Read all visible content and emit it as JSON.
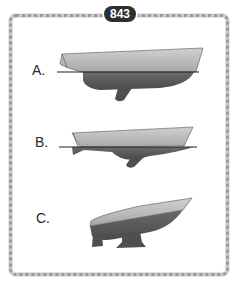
{
  "question": {
    "number": "843"
  },
  "options": [
    {
      "label": "A.",
      "description": "Hull floating level, deck above waterline, keel below"
    },
    {
      "label": "B.",
      "description": "Hull sitting low with waterline near deck"
    },
    {
      "label": "C.",
      "description": "Hull shown without waterline, bow raised"
    }
  ],
  "colors": {
    "badge_bg": "#2f2f2f",
    "badge_text": "#ffffff",
    "topsides": "#b9b9b9",
    "underwater": "#5e5e5e",
    "waterline": "#222222",
    "frame": "#b5b5b5"
  }
}
